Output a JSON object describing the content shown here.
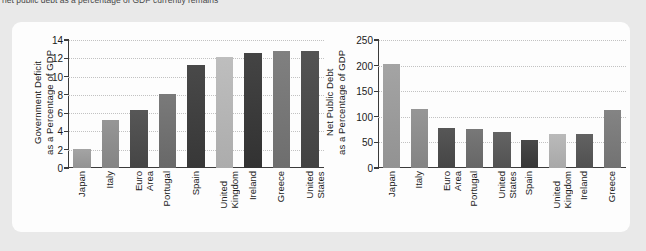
{
  "caption": "net public debt as a percentage of GDP currently remains",
  "chart_data": [
    {
      "type": "bar",
      "panel": "left",
      "title": "",
      "ylabel": "Government Deficit\nas a Percentage of GDP",
      "xlabel": "",
      "ylim": [
        0,
        14
      ],
      "yticks": [
        0,
        2,
        4,
        6,
        8,
        10,
        12,
        14
      ],
      "ytick_labels": [
        "0",
        "2",
        "4",
        "6",
        "8",
        "10",
        "12",
        "14"
      ],
      "grid": true,
      "legend": "none",
      "categories": [
        "Japan",
        "Italy",
        "Euro Area",
        "Portugal",
        "Spain",
        "United Kingdom",
        "Ireland",
        "Greece",
        "United States"
      ],
      "category_labels": [
        "Japan",
        "Italy",
        "Euro\nArea",
        "Portugal",
        "Spain",
        "United\nKingdom",
        "Ireland",
        "Greece",
        "United\nStates"
      ],
      "values": [
        2.1,
        5.3,
        6.3,
        8.1,
        11.3,
        12.1,
        12.6,
        12.8,
        12.8
      ],
      "bar_colors": [
        "#9a9a9a",
        "#8c8c8c",
        "#4d4d4d",
        "#707070",
        "#3f3f3f",
        "#b4b4b4",
        "#3a3a3a",
        "#767676",
        "#4a4a4a"
      ]
    },
    {
      "type": "bar",
      "panel": "right",
      "title": "",
      "ylabel": "Net Public Debt\nas a Percentage of GDP",
      "xlabel": "",
      "ylim": [
        0,
        250
      ],
      "yticks": [
        0,
        50,
        100,
        150,
        200,
        250
      ],
      "ytick_labels": [
        "0",
        "50",
        "100",
        "150",
        "200",
        "250"
      ],
      "grid": true,
      "legend": "none",
      "categories": [
        "Japan",
        "Italy",
        "Euro Area",
        "Portugal",
        "United States",
        "Spain",
        "United Kingdom",
        "Ireland",
        "Greece"
      ],
      "category_labels": [
        "Japan",
        "Italy",
        "Euro\nArea",
        "Portugal",
        "United\nStates",
        "Spain",
        "United\nKingdom",
        "Ireland",
        "Greece"
      ],
      "values": [
        203,
        116,
        78,
        76,
        70,
        54,
        66,
        67,
        113
      ],
      "bar_colors": [
        "#9a9a9a",
        "#8c8c8c",
        "#4d4d4d",
        "#6e6e6e",
        "#5a5a5a",
        "#3f3f3f",
        "#b0b0b0",
        "#585858",
        "#7a7a7a"
      ]
    }
  ],
  "colors": {
    "page_background": "#e9e9e9",
    "card_background": "#fdfdfd",
    "axis": "#3b3b3b",
    "gridline": "#c2c2c2",
    "text": "#1a1a1a"
  }
}
